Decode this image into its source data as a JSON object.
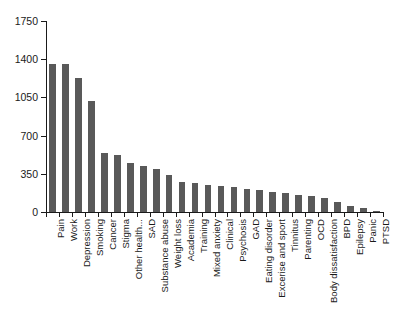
{
  "chart_data": {
    "type": "bar",
    "title": "",
    "subtitle": "",
    "xlabel": "",
    "ylabel": "",
    "ylim": [
      0,
      1750
    ],
    "ytick_labels": [
      "1750",
      "1400",
      "1050",
      "700",
      "350",
      "0"
    ],
    "ytick_values": [
      1750,
      1400,
      1050,
      700,
      350,
      0
    ],
    "grid": false,
    "legend": null,
    "legend_position": "none",
    "bar_color": "#595959",
    "axis_color": "#1a1a1a",
    "background_color": "#ffffff",
    "categories": [
      "Pain",
      "Work",
      "Depression",
      "Smoking",
      "Cancer",
      "Stigma",
      "Other health...",
      "SAD",
      "Substance abuse",
      "Weight loss",
      "Academia",
      "Training",
      "Mixed anxiety",
      "Clinical",
      "Psychosis",
      "GAD",
      "Eating disorder",
      "Excerise and sport",
      "Tinnitus",
      "Parenting",
      "OCD",
      "Body dissatisfaction",
      "BPD",
      "Epilepsy",
      "Panic",
      "PTSD"
    ],
    "values": [
      1360,
      1360,
      1230,
      1020,
      540,
      525,
      450,
      420,
      390,
      340,
      275,
      270,
      250,
      240,
      230,
      215,
      200,
      185,
      175,
      160,
      150,
      125,
      95,
      55,
      35,
      10
    ]
  }
}
